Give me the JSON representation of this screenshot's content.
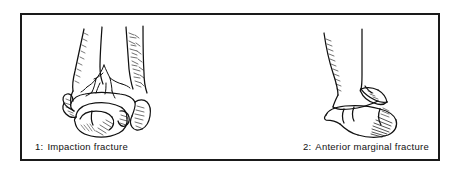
{
  "figure": {
    "panel_border_color": "#1a1a1a",
    "panel_background": "#ffffff",
    "ink_color": "#111111",
    "panels": [
      {
        "index_label": "1:",
        "caption_text": "Impaction fracture",
        "full_caption": "1: Impaction fracture",
        "view": "anterior view of distal tibia, fibula and talus with comminuted impaction fracture lines"
      },
      {
        "index_label": "2:",
        "caption_text": "Anterior marginal fracture",
        "full_caption": "2: Anterior marginal fracture",
        "view": "lateral view of distal tibia and talus with detached anterior marginal fragment"
      }
    ]
  }
}
